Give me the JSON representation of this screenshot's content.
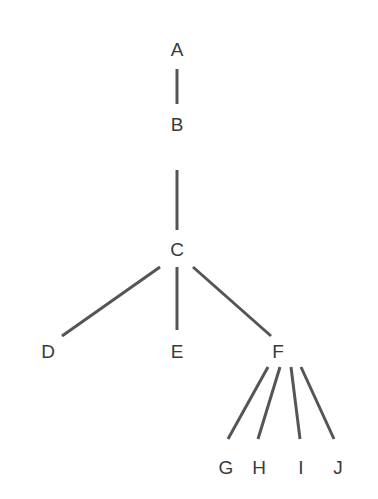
{
  "diagram": {
    "type": "tree",
    "nodes": [
      {
        "id": "A",
        "label": "A",
        "x": 177,
        "y": 56
      },
      {
        "id": "B",
        "label": "B",
        "x": 177,
        "y": 131
      },
      {
        "id": "C",
        "label": "C",
        "x": 177,
        "y": 256
      },
      {
        "id": "D",
        "label": "D",
        "x": 48,
        "y": 358
      },
      {
        "id": "E",
        "label": "E",
        "x": 177,
        "y": 358
      },
      {
        "id": "F",
        "label": "F",
        "x": 278,
        "y": 358
      },
      {
        "id": "G",
        "label": "G",
        "x": 226,
        "y": 474
      },
      {
        "id": "H",
        "label": "H",
        "x": 259,
        "y": 474
      },
      {
        "id": "I",
        "label": "I",
        "x": 301,
        "y": 474
      },
      {
        "id": "J",
        "label": "J",
        "x": 338,
        "y": 474
      }
    ],
    "edges": [
      {
        "from": "A",
        "to": "B",
        "x1": 177,
        "y1": 69,
        "x2": 177,
        "y2": 104
      },
      {
        "from": "B",
        "to": "C",
        "x1": 177,
        "y1": 170,
        "x2": 177,
        "y2": 230
      },
      {
        "from": "C",
        "to": "D",
        "x1": 160,
        "y1": 267,
        "x2": 62,
        "y2": 336
      },
      {
        "from": "C",
        "to": "E",
        "x1": 177,
        "y1": 267,
        "x2": 177,
        "y2": 330
      },
      {
        "from": "C",
        "to": "F",
        "x1": 193,
        "y1": 267,
        "x2": 271,
        "y2": 336
      },
      {
        "from": "F",
        "to": "G",
        "x1": 268,
        "y1": 367,
        "x2": 228,
        "y2": 439
      },
      {
        "from": "F",
        "to": "H",
        "x1": 280,
        "y1": 367,
        "x2": 258,
        "y2": 439
      },
      {
        "from": "F",
        "to": "I",
        "x1": 291,
        "y1": 367,
        "x2": 300,
        "y2": 439
      },
      {
        "from": "F",
        "to": "J",
        "x1": 301,
        "y1": 367,
        "x2": 334,
        "y2": 439
      }
    ]
  }
}
